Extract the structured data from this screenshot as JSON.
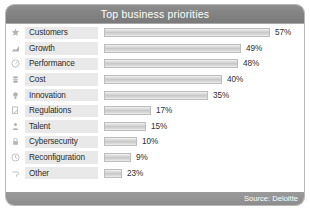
{
  "header": {
    "title": "Top business priorities"
  },
  "footer": {
    "source": "Source: Deloitte"
  },
  "colors": {
    "header_bg": "#828282",
    "footer_bg": "#8d8d8d",
    "bar_fill": "#c9c9c9",
    "bar_border": "#bdbdbd",
    "label_bg": "#e9e9e9",
    "card_border": "#b9b9b9",
    "text": "#2b2b2b",
    "icon": "#b4b4b4"
  },
  "chart_data": {
    "type": "bar",
    "title": "Top business priorities",
    "xlabel": "",
    "ylabel": "",
    "orientation": "horizontal",
    "grid": false,
    "legend": false,
    "xlim": [
      0,
      60
    ],
    "value_suffix": "%",
    "categories": [
      "Customers",
      "Growth",
      "Performance",
      "Cost",
      "Innovation",
      "Regulations",
      "Talent",
      "Cybersecurity",
      "Reconfiguration",
      "Other"
    ],
    "values": [
      57,
      49,
      48,
      40,
      35,
      17,
      15,
      10,
      9,
      23
    ],
    "value_labels": [
      "57%",
      "49%",
      "48%",
      "40%",
      "35%",
      "17%",
      "15%",
      "10%",
      "9%",
      "23%"
    ],
    "bar_px_widths": [
      166,
      137,
      134,
      118,
      104,
      47,
      42,
      33,
      27,
      18
    ],
    "icons": [
      "star-icon",
      "growth-chart-icon",
      "speedometer-icon",
      "coins-icon",
      "lightbulb-icon",
      "document-check-icon",
      "person-icon",
      "lock-icon",
      "clock-icon",
      "tag-icon"
    ]
  }
}
